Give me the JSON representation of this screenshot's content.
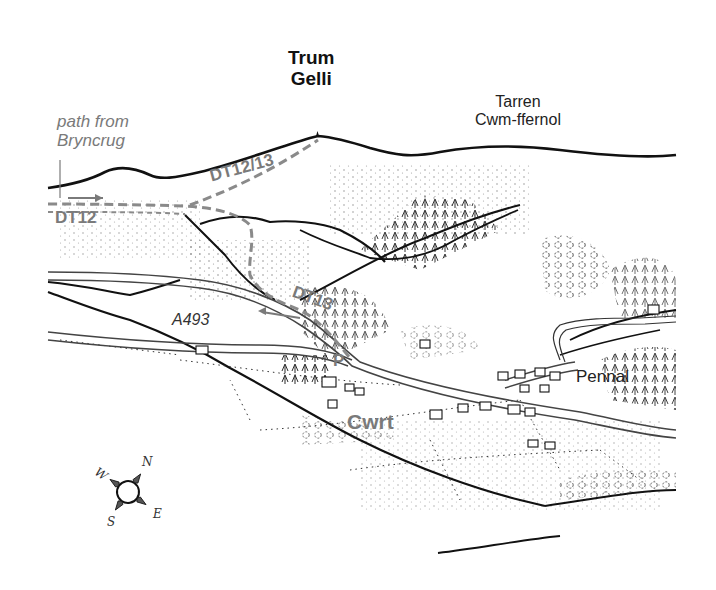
{
  "map": {
    "type": "hand-drawn panoramic walking map",
    "labels": {
      "peak": {
        "line1": "Trum",
        "line2": "Gelli"
      },
      "ridge": {
        "line1": "Tarren",
        "line2": "Cwm-ffernol"
      },
      "path_note": {
        "line1": "path from",
        "line2": "Bryncrug"
      },
      "route_dt12_13": "DT12/13",
      "route_dt12": "DT12",
      "route_dt13": "DT13",
      "road": "A493",
      "parking": "P",
      "village_cwrt": "Cwrt",
      "village_pennal": "Pennal"
    },
    "compass": {
      "n": "N",
      "e": "E",
      "s": "S",
      "w": "W"
    },
    "colors": {
      "ink": "#111111",
      "route_grey": "#8a8a8a",
      "label_grey": "#7a7a7a",
      "background": "#ffffff"
    }
  }
}
